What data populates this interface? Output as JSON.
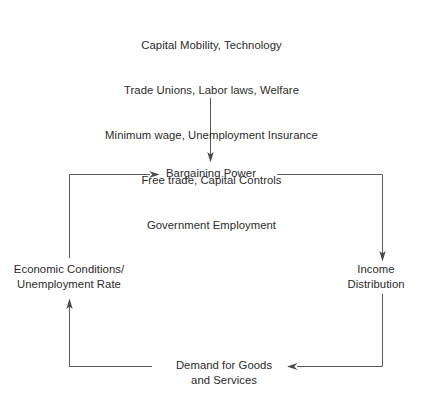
{
  "diagram": {
    "title_block": {
      "name": "policy-and-structural-inputs",
      "lines": [
        "Capital Mobility, Technology",
        "Trade Unions, Labor laws, Welfare",
        "Minimum wage, Unemployment Insurance",
        "Free trade, Capital Controls",
        "Government Employment"
      ]
    },
    "nodes": {
      "bargaining_power": "Bargaining Power",
      "economic_conditions": "Economic Conditions/\nUnemployment Rate",
      "income_distribution": "Income\nDistribution",
      "demand_goods": "Demand for Goods\nand Services"
    },
    "edges": [
      {
        "name": "inputs-to-bargaining-power",
        "from": "policy-and-structural-inputs",
        "to": "Bargaining Power",
        "direction": "down"
      },
      {
        "name": "bargaining-power-to-income-distribution",
        "from": "Bargaining Power",
        "to": "Income Distribution",
        "direction": "right-then-down"
      },
      {
        "name": "income-distribution-to-demand",
        "from": "Income Distribution",
        "to": "Demand for Goods and Services",
        "direction": "down-then-left"
      },
      {
        "name": "demand-to-economic-conditions",
        "from": "Demand for Goods and Services",
        "to": "Economic Conditions/Unemployment Rate",
        "direction": "left-then-up"
      },
      {
        "name": "economic-conditions-to-bargaining-power",
        "from": "Economic Conditions/Unemployment Rate",
        "to": "Bargaining Power",
        "direction": "up-then-right"
      }
    ],
    "colors": {
      "background": "#ffffff",
      "text": "#2b2b2b",
      "line": "#5a5a5a"
    }
  }
}
